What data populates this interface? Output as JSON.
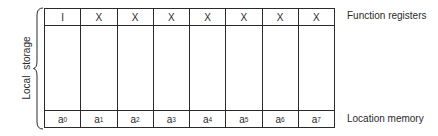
{
  "diagram": {
    "columns": [
      {
        "register": "I",
        "location": "a",
        "index": "0"
      },
      {
        "register": "X",
        "location": "a",
        "index": "1"
      },
      {
        "register": "X",
        "location": "a",
        "index": "2"
      },
      {
        "register": "X",
        "location": "a",
        "index": "3"
      },
      {
        "register": "X",
        "location": "a",
        "index": "4"
      },
      {
        "register": "X",
        "location": "a",
        "index": "5"
      },
      {
        "register": "X",
        "location": "a",
        "index": "6"
      },
      {
        "register": "X",
        "location": "a",
        "index": "7"
      }
    ],
    "labels": {
      "function_registers": "Function registers",
      "location_memory": "Location memory",
      "local_storage": "Local storage"
    },
    "colors": {
      "line": "#2a2a2a",
      "background": "#ffffff"
    }
  }
}
